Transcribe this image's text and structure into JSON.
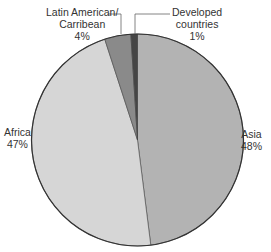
{
  "chart_data": {
    "type": "pie",
    "title": "",
    "start_angle_deg": 0,
    "direction": "clockwise",
    "categories": [
      "Asia",
      "Africa",
      "Latin American/ Carribean",
      "Developed countries"
    ],
    "values": [
      48,
      47,
      4,
      1
    ],
    "unit": "%",
    "colors": [
      "#b3b3b3",
      "#d6d6d6",
      "#8a8a8a",
      "#454545"
    ],
    "legend": "none",
    "labels": [
      {
        "lines": [
          "Asia",
          "48%"
        ]
      },
      {
        "lines": [
          "Africa",
          "47%"
        ]
      },
      {
        "lines": [
          "Latin American/",
          "Carribean",
          "4%"
        ]
      },
      {
        "lines": [
          "Developed",
          "countries",
          "1%"
        ]
      }
    ]
  }
}
